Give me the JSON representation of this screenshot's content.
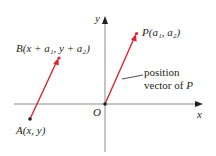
{
  "figure": {
    "type": "vector-diagram",
    "colors": {
      "vector": "#d7262e",
      "axis": "#8a8a8a",
      "axis_arrow": "#231f20",
      "point": "#231f20",
      "text": "#231f20"
    },
    "axes": {
      "x_label": "x",
      "y_label": "y",
      "origin_label": "O"
    },
    "points": {
      "B": {
        "name": "B",
        "coords": "(x + a₁, y + a₂)",
        "label": "B(x + a₁, y + a₂)"
      },
      "A": {
        "name": "A",
        "coords": "(x, y)",
        "label": "A(x, y)"
      },
      "P": {
        "name": "P",
        "coords": "(a₁, a₂)",
        "label": "P(a₁, a₂)"
      }
    },
    "vectors": [
      {
        "id": "AB",
        "from": "A",
        "to": "B",
        "description": "vector from A to B"
      },
      {
        "id": "OP",
        "from": "O",
        "to": "P",
        "description": "position vector of P"
      }
    ],
    "annotation": {
      "line1": "position",
      "line2_prefix": "vector of",
      "line2_var": "P"
    }
  }
}
